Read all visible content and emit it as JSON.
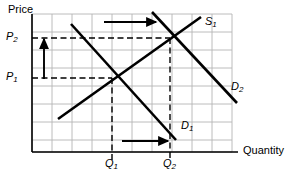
{
  "figure": {
    "type": "economics-supply-demand-diagram",
    "width": 300,
    "height": 181,
    "background_color": "#ffffff",
    "ink_color": "#000000",
    "grid_color": "#b4b4b4"
  },
  "axes": {
    "y_axis": {
      "title": "Price",
      "x_pixel": 32,
      "top_pixel": 14,
      "bottom_pixel": 152
    },
    "x_axis": {
      "title": "Quantity",
      "y_pixel": 152,
      "left_pixel": 32,
      "right_pixel": 238
    }
  },
  "grid": {
    "visible": true,
    "x_lines": [
      32,
      52,
      72,
      92,
      112,
      132,
      152,
      172,
      192,
      212,
      232
    ],
    "y_lines": [
      14,
      32,
      50,
      68,
      86,
      104,
      122,
      140,
      152
    ],
    "spacing_x": 20,
    "spacing_y": 18
  },
  "tick_labels": {
    "price": [
      {
        "id": "p2",
        "base": "P",
        "sub": "2",
        "value_pixel_y": 38
      },
      {
        "id": "p1",
        "base": "P",
        "sub": "1",
        "value_pixel_y": 78
      }
    ],
    "quantity": [
      {
        "id": "q1",
        "base": "Q",
        "sub": "1",
        "value_pixel_x": 112
      },
      {
        "id": "q2",
        "base": "Q",
        "sub": "2",
        "value_pixel_x": 170
      }
    ]
  },
  "curves": [
    {
      "id": "s1",
      "label_base": "S",
      "label_sub": "1",
      "kind": "supply",
      "slope": "upward",
      "x1": 58,
      "y1": 119,
      "x2": 201,
      "y2": 17
    },
    {
      "id": "d1",
      "label_base": "D",
      "label_sub": "1",
      "kind": "demand",
      "slope": "downward",
      "x1": 71,
      "y1": 24,
      "x2": 176,
      "y2": 140
    },
    {
      "id": "d2",
      "label_base": "D",
      "label_sub": "2",
      "kind": "demand",
      "slope": "downward",
      "x1": 152,
      "y1": 12,
      "x2": 237,
      "y2": 103
    }
  ],
  "equilibria": [
    {
      "id": "e1",
      "x": 112,
      "y": 78,
      "price": "P1",
      "quantity": "Q1"
    },
    {
      "id": "e2",
      "x": 170,
      "y": 38,
      "price": "P2",
      "quantity": "Q2"
    }
  ],
  "dashed_guides": [
    {
      "id": "p2-horizontal",
      "x1": 32,
      "y1": 38,
      "x2": 170,
      "y2": 38
    },
    {
      "id": "p1-horizontal",
      "x1": 32,
      "y1": 78,
      "x2": 112,
      "y2": 78
    },
    {
      "id": "q1-vertical",
      "x1": 112,
      "y1": 78,
      "x2": 112,
      "y2": 160
    },
    {
      "id": "q2-vertical",
      "x1": 170,
      "y1": 38,
      "x2": 170,
      "y2": 160
    }
  ],
  "shift_arrows": [
    {
      "id": "price-up-arrow",
      "direction": "up",
      "x1": 44,
      "y1": 79,
      "x2": 44,
      "y2": 39
    },
    {
      "id": "demand-shift-right-arrow",
      "direction": "right",
      "x1": 104,
      "y1": 22,
      "x2": 156,
      "y2": 22
    },
    {
      "id": "quantity-right-arrow",
      "direction": "right",
      "x1": 122,
      "y1": 141,
      "x2": 168,
      "y2": 141
    }
  ]
}
